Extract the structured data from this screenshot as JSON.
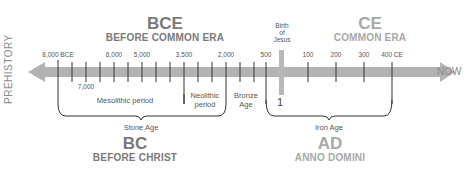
{
  "top_cutoff_text": "…",
  "eras": {
    "bce": {
      "abbr": "BCE",
      "full": "BEFORE COMMON ERA"
    },
    "ce": {
      "abbr": "CE",
      "full": "COMMON ERA"
    },
    "bc": {
      "abbr": "BC",
      "full": "BEFORE CHRIST"
    },
    "ad": {
      "abbr": "AD",
      "full": "ANNO DOMINI"
    }
  },
  "axis": {
    "left_label": "PREHISTORY",
    "right_label": "NOW",
    "bar_color": "#b3b3b3",
    "tick_color": "#333333"
  },
  "marker": {
    "label_line1": "Birth",
    "label_line2": "of",
    "label_line3": "Jesus",
    "year": "1",
    "color": "#b8b8b8"
  },
  "tick_labels": {
    "t8000": "8,000 BCE",
    "t7000": "7,000",
    "t6000": "6,000",
    "t5000": "5,000",
    "t3500": "3,500",
    "t2000": "2,000",
    "t500": "500",
    "t100": "100",
    "t200": "200",
    "t300": "300",
    "t400": "400 CE"
  },
  "periods": {
    "mesolithic": "Mesolithic period",
    "neolithic_l1": "Neolithic",
    "neolithic_l2": "period",
    "bronze_l1": "Bronze",
    "bronze_l2": "Age",
    "stone_age": "Stone Age",
    "iron_age": "Iron Age"
  }
}
